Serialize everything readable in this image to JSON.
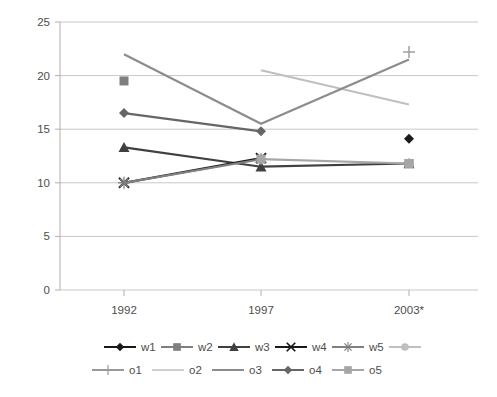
{
  "chart_data": {
    "type": "line",
    "title": "",
    "xlabel": "",
    "ylabel": "",
    "categories": [
      "1992",
      "1997",
      "2003*"
    ],
    "x_positions": [
      124,
      261,
      409
    ],
    "ylim": [
      0,
      25
    ],
    "yticks": [
      0,
      5,
      10,
      15,
      20,
      25
    ],
    "grid": true,
    "legend_position": "bottom",
    "series": [
      {
        "name": "w1",
        "marker": "diamond",
        "color": "#1a1a1a",
        "values": [
          null,
          null,
          14.1
        ],
        "line": false
      },
      {
        "name": "w2",
        "marker": "square",
        "color": "#7f7f7f",
        "values": [
          19.5,
          null,
          11.8
        ],
        "line": false
      },
      {
        "name": "w3",
        "marker": "triangle",
        "color": "#404040",
        "values": [
          13.3,
          11.5,
          11.8
        ],
        "line": true
      },
      {
        "name": "w4",
        "marker": "x",
        "color": "#1a1a1a",
        "values": [
          10.0,
          12.3,
          null
        ],
        "line": true
      },
      {
        "name": "w5",
        "marker": "star",
        "color": "#808080",
        "values": [
          10.0,
          12.2,
          null
        ],
        "line": true
      },
      {
        "name": "o1",
        "marker": "plus",
        "color": "#999999",
        "values": [
          null,
          null,
          22.2
        ],
        "line": false
      },
      {
        "name": "o2",
        "marker": "none",
        "color": "#bfbfbf",
        "values": [
          null,
          20.5,
          17.3
        ],
        "line": true
      },
      {
        "name": "o3",
        "marker": "none",
        "color": "#8c8c8c",
        "values": [
          22.0,
          15.5,
          21.5
        ],
        "line": true
      },
      {
        "name": "o4",
        "marker": "diamond",
        "color": "#666666",
        "values": [
          16.5,
          14.8,
          null
        ],
        "line": true
      },
      {
        "name": "o5",
        "marker": "square",
        "color": "#a6a6a6",
        "values": [
          null,
          12.2,
          11.8
        ],
        "line": true
      }
    ],
    "legend_rows": [
      [
        "w1",
        "w2",
        "w3",
        "w4",
        "w5"
      ],
      [
        "o1",
        "o2",
        "o3",
        "o4",
        "o5"
      ]
    ]
  },
  "axis": {
    "y_labels": [
      "25",
      "20",
      "15",
      "10",
      "5",
      "0"
    ],
    "x_labels": [
      "1992",
      "1997",
      "2003*"
    ]
  },
  "legend": {
    "row1": [
      {
        "label": "w1",
        "marker": "diamond",
        "color": "#1a1a1a"
      },
      {
        "label": "w2",
        "marker": "square",
        "color": "#7f7f7f"
      },
      {
        "label": "w3",
        "marker": "triangle",
        "color": "#404040"
      },
      {
        "label": "w4",
        "marker": "x",
        "color": "#1a1a1a"
      },
      {
        "label": "w5",
        "marker": "star",
        "color": "#808080"
      },
      {
        "label": "",
        "marker": "circle",
        "color": "#bfbfbf"
      }
    ],
    "row2": [
      {
        "label": "o1",
        "marker": "plus",
        "color": "#999999"
      },
      {
        "label": "o2",
        "marker": "none",
        "color": "#d0d0d0"
      },
      {
        "label": "o3",
        "marker": "none",
        "color": "#8c8c8c"
      },
      {
        "label": "o4",
        "marker": "diamond",
        "color": "#666666"
      },
      {
        "label": "o5",
        "marker": "square",
        "color": "#a6a6a6"
      }
    ]
  },
  "colors": {
    "gridline": "#c8c8c8",
    "axis": "#b0b0b0",
    "text": "#4d4d4d",
    "background": "#ffffff"
  }
}
